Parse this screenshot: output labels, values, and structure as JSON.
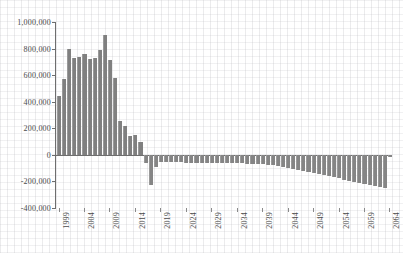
{
  "chart_data": {
    "type": "bar",
    "title": "",
    "subtitle": "",
    "xlabel": "",
    "ylabel": "",
    "legend": [],
    "grid": true,
    "legend_position": "none",
    "bar_color": "#808080",
    "axis_color": "#6e6e6e",
    "ylim": [
      -400000,
      1000000
    ],
    "ytick_values": [
      1000000,
      800000,
      600000,
      400000,
      200000,
      0,
      -200000,
      -400000
    ],
    "ytick_labels": [
      "1,000,000",
      "800,000",
      "600,000",
      "400,000",
      "200,000",
      "0",
      "-200,000",
      "-400,000"
    ],
    "xtick_labels": [
      "1999",
      "2004",
      "2009",
      "2014",
      "2019",
      "2024",
      "2029",
      "2034",
      "2039",
      "2044",
      "2049",
      "2054",
      "2059",
      "2064"
    ],
    "xtick_step": 5,
    "x_start": 1999,
    "x_end": 2064,
    "categories": [
      1999,
      2000,
      2001,
      2002,
      2003,
      2004,
      2005,
      2006,
      2007,
      2008,
      2009,
      2010,
      2011,
      2012,
      2013,
      2014,
      2015,
      2016,
      2017,
      2018,
      2019,
      2020,
      2021,
      2022,
      2023,
      2024,
      2025,
      2026,
      2027,
      2028,
      2029,
      2030,
      2031,
      2032,
      2033,
      2034,
      2035,
      2036,
      2037,
      2038,
      2039,
      2040,
      2041,
      2042,
      2043,
      2044,
      2045,
      2046,
      2047,
      2048,
      2049,
      2050,
      2051,
      2052,
      2053,
      2054,
      2055,
      2056,
      2057,
      2058,
      2059,
      2060,
      2061,
      2062,
      2063,
      2064
    ],
    "values": [
      440000,
      570000,
      800000,
      730000,
      740000,
      760000,
      720000,
      730000,
      790000,
      900000,
      715000,
      580000,
      255000,
      215000,
      140000,
      150000,
      95000,
      -60000,
      -230000,
      -90000,
      -55000,
      -55000,
      -56000,
      -57000,
      -57000,
      -58000,
      -58000,
      -59000,
      -60000,
      -60000,
      -61000,
      -62000,
      -62000,
      -63000,
      -64000,
      -65000,
      -65000,
      -66000,
      -67000,
      -68000,
      -70000,
      -74000,
      -80000,
      -86000,
      -92000,
      -99000,
      -106000,
      -113000,
      -121000,
      -129000,
      -137000,
      -146000,
      -154000,
      -162000,
      -170000,
      -178000,
      -186000,
      -194000,
      -202000,
      -210000,
      -218000,
      -226000,
      -233000,
      -240000,
      -248000,
      -18000
    ]
  }
}
